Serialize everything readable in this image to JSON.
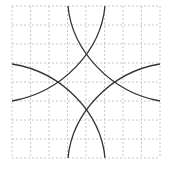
{
  "diagram": {
    "grid": {
      "cells_x": 8,
      "cells_y": 8,
      "line_color": "#c8c8c8",
      "dash": "2,2"
    },
    "arc_color": "#333333",
    "arcs": [
      {
        "d": "M68,6 C72,50 110,92 160,101"
      },
      {
        "d": "M105,6 C101,50 63,92 12,101"
      },
      {
        "d": "M68,158 C72,114 110,72 160,64"
      },
      {
        "d": "M105,158 C101,114 63,72 12,64"
      }
    ]
  }
}
